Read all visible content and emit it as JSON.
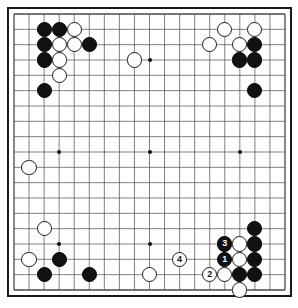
{
  "app": {
    "title": "Go Board Diagram",
    "board_size": 19,
    "colors": {
      "board_background": "#ffffff",
      "line": "#4a4a4a",
      "border": "#1a1a1a",
      "black_stone": "#111111",
      "white_stone": "#ffffff",
      "black_label": "#ffffff",
      "white_label": "#111111"
    }
  },
  "board": {
    "size": 19,
    "hoshi": [
      {
        "col": 3,
        "row": 3
      },
      {
        "col": 9,
        "row": 3
      },
      {
        "col": 15,
        "row": 3
      },
      {
        "col": 3,
        "row": 9
      },
      {
        "col": 9,
        "row": 9
      },
      {
        "col": 15,
        "row": 9
      },
      {
        "col": 3,
        "row": 15
      },
      {
        "col": 9,
        "row": 15
      },
      {
        "col": 15,
        "row": 15
      }
    ],
    "stones": [
      {
        "col": 2,
        "row": 1,
        "color": "black",
        "label": ""
      },
      {
        "col": 3,
        "row": 1,
        "color": "black",
        "label": ""
      },
      {
        "col": 4,
        "row": 1,
        "color": "white",
        "label": ""
      },
      {
        "col": 2,
        "row": 2,
        "color": "black",
        "label": ""
      },
      {
        "col": 3,
        "row": 2,
        "color": "white",
        "label": ""
      },
      {
        "col": 4,
        "row": 2,
        "color": "white",
        "label": ""
      },
      {
        "col": 5,
        "row": 2,
        "color": "black",
        "label": ""
      },
      {
        "col": 2,
        "row": 3,
        "color": "black",
        "label": ""
      },
      {
        "col": 3,
        "row": 3,
        "color": "white",
        "label": ""
      },
      {
        "col": 3,
        "row": 4,
        "color": "white",
        "label": ""
      },
      {
        "col": 2,
        "row": 5,
        "color": "black",
        "label": ""
      },
      {
        "col": 8,
        "row": 3,
        "color": "white",
        "label": ""
      },
      {
        "col": 14,
        "row": 1,
        "color": "white",
        "label": ""
      },
      {
        "col": 16,
        "row": 1,
        "color": "white",
        "label": ""
      },
      {
        "col": 13,
        "row": 2,
        "color": "white",
        "label": ""
      },
      {
        "col": 15,
        "row": 2,
        "color": "white",
        "label": ""
      },
      {
        "col": 16,
        "row": 2,
        "color": "black",
        "label": ""
      },
      {
        "col": 15,
        "row": 3,
        "color": "black",
        "label": ""
      },
      {
        "col": 16,
        "row": 3,
        "color": "black",
        "label": ""
      },
      {
        "col": 16,
        "row": 5,
        "color": "black",
        "label": ""
      },
      {
        "col": 1,
        "row": 10,
        "color": "white",
        "label": ""
      },
      {
        "col": 2,
        "row": 14,
        "color": "white",
        "label": ""
      },
      {
        "col": 1,
        "row": 16,
        "color": "white",
        "label": ""
      },
      {
        "col": 3,
        "row": 16,
        "color": "black",
        "label": ""
      },
      {
        "col": 2,
        "row": 17,
        "color": "black",
        "label": ""
      },
      {
        "col": 5,
        "row": 17,
        "color": "black",
        "label": ""
      },
      {
        "col": 9,
        "row": 17,
        "color": "white",
        "label": ""
      },
      {
        "col": 16,
        "row": 14,
        "color": "black",
        "label": ""
      },
      {
        "col": 15,
        "row": 15,
        "color": "white",
        "label": ""
      },
      {
        "col": 16,
        "row": 15,
        "color": "black",
        "label": ""
      },
      {
        "col": 14,
        "row": 15,
        "color": "black",
        "label": "3"
      },
      {
        "col": 14,
        "row": 16,
        "color": "black",
        "label": "1"
      },
      {
        "col": 15,
        "row": 16,
        "color": "white",
        "label": ""
      },
      {
        "col": 16,
        "row": 16,
        "color": "black",
        "label": ""
      },
      {
        "col": 14,
        "row": 17,
        "color": "white",
        "label": ""
      },
      {
        "col": 15,
        "row": 17,
        "color": "black",
        "label": ""
      },
      {
        "col": 16,
        "row": 17,
        "color": "black",
        "label": ""
      },
      {
        "col": 13,
        "row": 17,
        "color": "white",
        "label": "2"
      },
      {
        "col": 15,
        "row": 18,
        "color": "white",
        "label": ""
      },
      {
        "col": 11,
        "row": 16,
        "color": "white",
        "label": "4"
      }
    ]
  }
}
